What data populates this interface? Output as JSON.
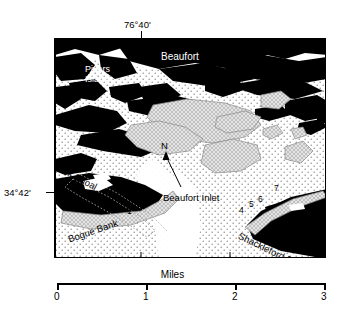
{
  "figure": {
    "type": "map"
  },
  "graticule": {
    "longitude_label": "76°40'",
    "latitude_label": "34°42'"
  },
  "place_labels": [
    {
      "name": "beaufort",
      "text": "Beaufort"
    },
    {
      "name": "pivers-island-line1",
      "text": "Pivers"
    },
    {
      "name": "pivers-island-line2",
      "text": "Island"
    },
    {
      "name": "shark-shoal",
      "text": "Shark Shoal"
    },
    {
      "name": "beaufort-inlet",
      "text": "Beaufort Inlet"
    },
    {
      "name": "bogue-bank",
      "text": "Bogue Bank"
    },
    {
      "name": "shackleford-bank",
      "text": "Shackleford Bank"
    }
  ],
  "north_arrow": {
    "label": "N"
  },
  "stations": [
    {
      "id": "station-1",
      "label": "1"
    },
    {
      "id": "station-2",
      "label": "2"
    },
    {
      "id": "station-3",
      "label": "3"
    },
    {
      "id": "station-4",
      "label": "4"
    },
    {
      "id": "station-5",
      "label": "5"
    },
    {
      "id": "station-6",
      "label": "6"
    },
    {
      "id": "station-7",
      "label": "7"
    },
    {
      "id": "station-8",
      "label": "8"
    }
  ],
  "scalebar": {
    "unit_label": "Miles",
    "ticks": [
      "0",
      "1",
      "2",
      "3"
    ]
  },
  "colors": {
    "land": "#000000",
    "water": "#ffffff",
    "shoal": "#d9d9d9",
    "stipple": "#9a9a9a",
    "frame": "#000000",
    "text": "#000000"
  }
}
